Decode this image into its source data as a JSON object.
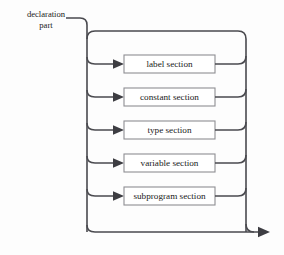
{
  "diagram": {
    "kind": "railroad-syntax-diagram",
    "entry_label": "declaration\npart",
    "entry_label_line1": "declaration",
    "entry_label_line2": "part",
    "colors": {
      "background": "#fdfdfd",
      "rail": "#4a4a4f",
      "box_border": "#8e8e93",
      "box_fill": "#ffffff",
      "text": "#1a1a1a",
      "arrow": "#3d3d42"
    },
    "branches": [
      {
        "id": "label-section",
        "label": "label section"
      },
      {
        "id": "constant-section",
        "label": "constant section"
      },
      {
        "id": "type-section",
        "label": "type section"
      },
      {
        "id": "variable-section",
        "label": "variable section"
      },
      {
        "id": "subprogram-section",
        "label": "subprogram section"
      }
    ]
  }
}
